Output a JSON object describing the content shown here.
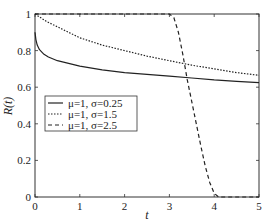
{
  "chart_data": {
    "type": "line",
    "title": "",
    "xlabel": "t",
    "ylabel": "R(t)",
    "xlim": [
      0,
      5
    ],
    "ylim": [
      0,
      1
    ],
    "xticks": [
      0,
      1,
      2,
      3,
      4,
      5
    ],
    "yticks": [
      0,
      0.2,
      0.4,
      0.6,
      0.8,
      1
    ],
    "xtick_labels": [
      "0",
      "1",
      "2",
      "3",
      "4",
      "5"
    ],
    "ytick_labels": [
      "0",
      "0.2",
      "0.4",
      "0.6",
      "0.8",
      "1"
    ],
    "grid": false,
    "legend_position": "center-left",
    "series": [
      {
        "name": "μ=1, σ=0.25",
        "style": "solid",
        "x": [
          0,
          0.02,
          0.05,
          0.1,
          0.2,
          0.3,
          0.5,
          0.75,
          1,
          1.5,
          2,
          2.5,
          3,
          3.5,
          4,
          4.5,
          5
        ],
        "y": [
          0.9,
          0.86,
          0.83,
          0.805,
          0.78,
          0.765,
          0.745,
          0.73,
          0.715,
          0.695,
          0.68,
          0.67,
          0.66,
          0.65,
          0.64,
          0.632,
          0.625
        ]
      },
      {
        "name": "μ=1, σ=1.5",
        "style": "dotted",
        "x": [
          0,
          0.25,
          0.5,
          0.75,
          1,
          1.5,
          2,
          2.5,
          3,
          3.5,
          4,
          4.5,
          5
        ],
        "y": [
          1,
          0.96,
          0.93,
          0.9,
          0.87,
          0.83,
          0.8,
          0.77,
          0.745,
          0.72,
          0.7,
          0.68,
          0.665
        ]
      },
      {
        "name": "μ=1, σ=2.5",
        "style": "dashed",
        "x": [
          0,
          3.0,
          3.1,
          3.2,
          3.3,
          3.4,
          3.5,
          3.6,
          3.7,
          3.8,
          3.9,
          4.0,
          4.1,
          5
        ],
        "y": [
          1,
          1,
          0.98,
          0.9,
          0.78,
          0.64,
          0.52,
          0.4,
          0.28,
          0.17,
          0.08,
          0.02,
          0,
          0
        ]
      }
    ]
  },
  "legend": {
    "items": [
      "μ=1, σ=0.25",
      "μ=1, σ=1.5",
      "μ=1, σ=2.5"
    ]
  },
  "axes": {
    "xlabel": "t",
    "ylabel": "R(t)"
  }
}
